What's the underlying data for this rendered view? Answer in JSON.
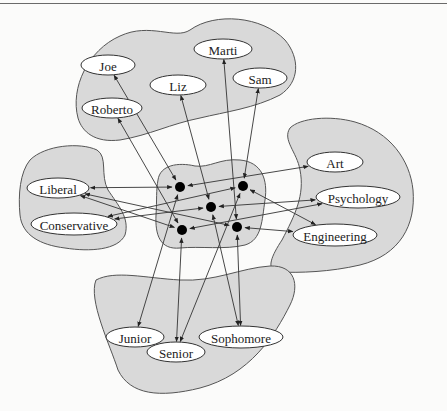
{
  "figure": {
    "groups": [
      {
        "id": "people",
        "label": "Students"
      },
      {
        "id": "politics",
        "label": "Political leaning"
      },
      {
        "id": "majors",
        "label": "Majors"
      },
      {
        "id": "years",
        "label": "Class years"
      },
      {
        "id": "center",
        "label": "Central nodes"
      }
    ],
    "nodes": [
      {
        "id": "joe",
        "label": "Joe",
        "group": "people",
        "x": 108,
        "y": 65,
        "rx": 27,
        "ry": 10
      },
      {
        "id": "marti",
        "label": "Marti",
        "group": "people",
        "x": 223,
        "y": 49,
        "rx": 29,
        "ry": 10
      },
      {
        "id": "liz",
        "label": "Liz",
        "group": "people",
        "x": 178,
        "y": 85,
        "rx": 28,
        "ry": 10
      },
      {
        "id": "sam",
        "label": "Sam",
        "group": "people",
        "x": 260,
        "y": 78,
        "rx": 27,
        "ry": 10
      },
      {
        "id": "roberto",
        "label": "Roberto",
        "group": "people",
        "x": 112,
        "y": 108,
        "rx": 30,
        "ry": 10
      },
      {
        "id": "art",
        "label": "Art",
        "group": "majors",
        "x": 335,
        "y": 162,
        "rx": 28,
        "ry": 10
      },
      {
        "id": "psychology",
        "label": "Psychology",
        "group": "majors",
        "x": 358,
        "y": 197,
        "rx": 42,
        "ry": 11
      },
      {
        "id": "engineering",
        "label": "Engineering",
        "group": "majors",
        "x": 335,
        "y": 235,
        "rx": 42,
        "ry": 11
      },
      {
        "id": "liberal",
        "label": "Liberal",
        "group": "politics",
        "x": 58,
        "y": 188,
        "rx": 31,
        "ry": 10
      },
      {
        "id": "conservative",
        "label": "Conservative",
        "group": "politics",
        "x": 74,
        "y": 224,
        "rx": 43,
        "ry": 11
      },
      {
        "id": "junior",
        "label": "Junior",
        "group": "years",
        "x": 135,
        "y": 337,
        "rx": 29,
        "ry": 10
      },
      {
        "id": "sophomore",
        "label": "Sophomore",
        "group": "years",
        "x": 241,
        "y": 337,
        "rx": 42,
        "ry": 11
      },
      {
        "id": "senior",
        "label": "Senior",
        "group": "years",
        "x": 176,
        "y": 352,
        "rx": 29,
        "ry": 10
      },
      {
        "id": "c1",
        "label": "",
        "group": "center",
        "x": 180,
        "y": 187,
        "r": 5
      },
      {
        "id": "c2",
        "label": "",
        "group": "center",
        "x": 243,
        "y": 186,
        "r": 5
      },
      {
        "id": "c3",
        "label": "",
        "group": "center",
        "x": 211,
        "y": 207,
        "r": 5
      },
      {
        "id": "c4",
        "label": "",
        "group": "center",
        "x": 182,
        "y": 230,
        "r": 5
      },
      {
        "id": "c5",
        "label": "",
        "group": "center",
        "x": 237,
        "y": 227,
        "r": 5
      }
    ],
    "edges": [
      {
        "from": "c1",
        "to": "joe",
        "dir": "both"
      },
      {
        "from": "c1",
        "to": "liberal",
        "dir": "both"
      },
      {
        "from": "c1",
        "to": "art",
        "dir": "both"
      },
      {
        "from": "c1",
        "to": "junior",
        "dir": "both"
      },
      {
        "from": "c2",
        "to": "sam",
        "dir": "both"
      },
      {
        "from": "c2",
        "to": "conservative",
        "dir": "both"
      },
      {
        "from": "c2",
        "to": "engineering",
        "dir": "both"
      },
      {
        "from": "c2",
        "to": "senior",
        "dir": "both"
      },
      {
        "from": "c3",
        "to": "liz",
        "dir": "both"
      },
      {
        "from": "c3",
        "to": "conservative",
        "dir": "both"
      },
      {
        "from": "c3",
        "to": "psychology",
        "dir": "both"
      },
      {
        "from": "c3",
        "to": "sophomore",
        "dir": "both"
      },
      {
        "from": "c4",
        "to": "roberto",
        "dir": "both"
      },
      {
        "from": "c4",
        "to": "liberal",
        "dir": "both"
      },
      {
        "from": "c4",
        "to": "psychology",
        "dir": "both"
      },
      {
        "from": "c4",
        "to": "senior",
        "dir": "both"
      },
      {
        "from": "c5",
        "to": "marti",
        "dir": "both"
      },
      {
        "from": "c5",
        "to": "liberal",
        "dir": "both"
      },
      {
        "from": "c5",
        "to": "engineering",
        "dir": "both"
      },
      {
        "from": "c5",
        "to": "sophomore",
        "dir": "both"
      }
    ]
  }
}
